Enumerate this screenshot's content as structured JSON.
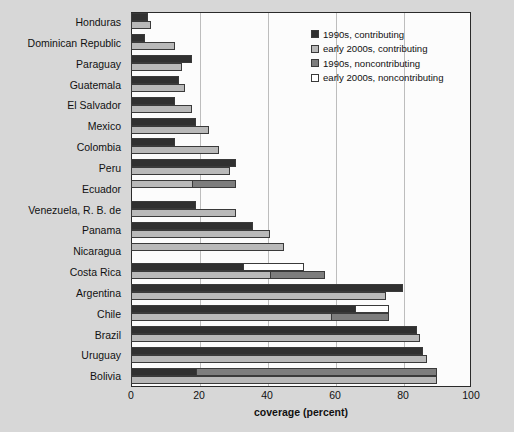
{
  "chart_data": {
    "type": "bar",
    "orientation": "horizontal",
    "title": "",
    "xlabel": "coverage (percent)",
    "ylabel": "",
    "xlim": [
      0,
      100
    ],
    "xticks": [
      0,
      20,
      40,
      60,
      80,
      100
    ],
    "grid": true,
    "legend_position": "top-right",
    "legend": [
      {
        "label": "1990s, contributing",
        "color": "#303030"
      },
      {
        "label": "early 2000s, contributing",
        "color": "#b9b9b9"
      },
      {
        "label": "1990s, noncontributing",
        "color": "#7d7d7d"
      },
      {
        "label": "early 2000s, noncontributing",
        "color": "#ffffff"
      }
    ],
    "categories": [
      "Honduras",
      "Dominican Republic",
      "Paraguay",
      "Guatemala",
      "El Salvador",
      "Mexico",
      "Colombia",
      "Peru",
      "Ecuador",
      "Venezuela, R. B. de",
      "Panama",
      "Nicaragua",
      "Costa Rica",
      "Argentina",
      "Chile",
      "Brazil",
      "Uruguay",
      "Bolivia"
    ],
    "series": [
      {
        "name": "1990s, contributing",
        "key": "s1990_contrib",
        "values": [
          5,
          4,
          18,
          14,
          13,
          19,
          13,
          31,
          0,
          19,
          36,
          0,
          33,
          80,
          66,
          84,
          86,
          19
        ]
      },
      {
        "name": "1990s, noncontributing",
        "key": "s1990_noncontrib",
        "values": [
          0,
          0,
          0,
          0,
          0,
          0,
          0,
          0,
          0,
          0,
          0,
          0,
          0,
          0,
          0,
          0,
          0,
          71
        ]
      },
      {
        "name": "early 2000s, contributing",
        "key": "s2000_contrib",
        "values": [
          6,
          13,
          15,
          16,
          18,
          23,
          26,
          29,
          18,
          31,
          41,
          45,
          41,
          75,
          59,
          85,
          87,
          0
        ]
      },
      {
        "name": "early 2000s, noncontributing",
        "key": "s2000_noncontrib",
        "values": [
          0,
          0,
          0,
          0,
          0,
          0,
          0,
          0,
          0,
          0,
          0,
          0,
          18,
          0,
          10,
          0,
          0,
          0
        ]
      }
    ],
    "bars": [
      {
        "category": "Honduras",
        "top": [
          {
            "series": "1990s, contributing",
            "value": 5
          }
        ],
        "bottom": [
          {
            "series": "early 2000s, contributing",
            "value": 6
          }
        ]
      },
      {
        "category": "Dominican Republic",
        "top": [
          {
            "series": "1990s, contributing",
            "value": 4
          }
        ],
        "bottom": [
          {
            "series": "early 2000s, contributing",
            "value": 13
          }
        ]
      },
      {
        "category": "Paraguay",
        "top": [
          {
            "series": "1990s, contributing",
            "value": 18
          }
        ],
        "bottom": [
          {
            "series": "early 2000s, contributing",
            "value": 15
          }
        ]
      },
      {
        "category": "Guatemala",
        "top": [
          {
            "series": "1990s, contributing",
            "value": 14
          }
        ],
        "bottom": [
          {
            "series": "early 2000s, contributing",
            "value": 16
          }
        ]
      },
      {
        "category": "El Salvador",
        "top": [
          {
            "series": "1990s, contributing",
            "value": 13
          }
        ],
        "bottom": [
          {
            "series": "early 2000s, contributing",
            "value": 18
          }
        ]
      },
      {
        "category": "Mexico",
        "top": [
          {
            "series": "1990s, contributing",
            "value": 19
          }
        ],
        "bottom": [
          {
            "series": "early 2000s, contributing",
            "value": 23
          }
        ]
      },
      {
        "category": "Colombia",
        "top": [
          {
            "series": "1990s, contributing",
            "value": 13
          }
        ],
        "bottom": [
          {
            "series": "early 2000s, contributing",
            "value": 26
          }
        ]
      },
      {
        "category": "Peru",
        "top": [
          {
            "series": "1990s, contributing",
            "value": 31
          }
        ],
        "bottom": [
          {
            "series": "early 2000s, contributing",
            "value": 29
          }
        ]
      },
      {
        "category": "Ecuador",
        "top": [
          {
            "series": "early 2000s, contributing",
            "value": 18
          },
          {
            "series": "1990s, noncontributing",
            "value": 13
          }
        ],
        "bottom": []
      },
      {
        "category": "Venezuela, R. B. de",
        "top": [
          {
            "series": "1990s, contributing",
            "value": 19
          }
        ],
        "bottom": [
          {
            "series": "early 2000s, contributing",
            "value": 31
          }
        ]
      },
      {
        "category": "Panama",
        "top": [
          {
            "series": "1990s, contributing",
            "value": 36
          }
        ],
        "bottom": [
          {
            "series": "early 2000s, contributing",
            "value": 41
          }
        ]
      },
      {
        "category": "Nicaragua",
        "top": [
          {
            "series": "early 2000s, contributing",
            "value": 45
          }
        ],
        "bottom": []
      },
      {
        "category": "Costa Rica",
        "top": [
          {
            "series": "1990s, contributing",
            "value": 33
          },
          {
            "series": "early 2000s, noncontributing",
            "value": 18
          }
        ],
        "bottom": [
          {
            "series": "early 2000s, contributing",
            "value": 41
          },
          {
            "series": "1990s, noncontributing",
            "value": 16
          }
        ]
      },
      {
        "category": "Argentina",
        "top": [
          {
            "series": "1990s, contributing",
            "value": 80
          }
        ],
        "bottom": [
          {
            "series": "early 2000s, contributing",
            "value": 75
          }
        ]
      },
      {
        "category": "Chile",
        "top": [
          {
            "series": "1990s, contributing",
            "value": 66
          },
          {
            "series": "early 2000s, noncontributing",
            "value": 10
          }
        ],
        "bottom": [
          {
            "series": "early 2000s, contributing",
            "value": 59
          },
          {
            "series": "1990s, noncontributing",
            "value": 17
          }
        ]
      },
      {
        "category": "Brazil",
        "top": [
          {
            "series": "1990s, contributing",
            "value": 84
          }
        ],
        "bottom": [
          {
            "series": "early 2000s, contributing",
            "value": 85
          }
        ]
      },
      {
        "category": "Uruguay",
        "top": [
          {
            "series": "1990s, contributing",
            "value": 86
          }
        ],
        "bottom": [
          {
            "series": "early 2000s, contributing",
            "value": 87
          }
        ]
      },
      {
        "category": "Bolivia",
        "top": [
          {
            "series": "1990s, contributing",
            "value": 19
          },
          {
            "series": "1990s, noncontributing",
            "value": 71
          }
        ],
        "bottom": [
          {
            "series": "early 2000s, contributing",
            "value": 90
          }
        ]
      }
    ]
  },
  "colors": {
    "background": "#d7d7d7",
    "plot_background": "#fcfcfc",
    "axis": "#2a2a2a",
    "grid": "#bdbdbd",
    "dark": "#303030",
    "light": "#b9b9b9",
    "medium": "#7d7d7d",
    "white": "#ffffff"
  }
}
